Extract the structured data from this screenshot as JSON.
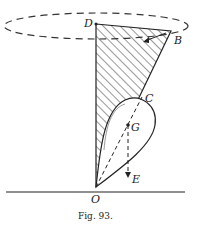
{
  "figure": {
    "caption": "Fig. 93.",
    "labels": {
      "D": "D",
      "B": "B",
      "C": "C",
      "G": "G",
      "E": "E",
      "O": "O"
    },
    "colors": {
      "ink": "#222222",
      "background": "#ffffff"
    }
  }
}
